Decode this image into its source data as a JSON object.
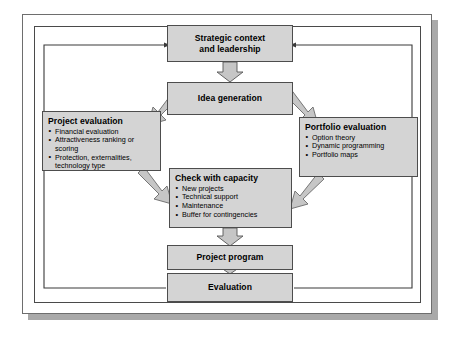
{
  "diagram": {
    "colors": {
      "box_fill": "#d4d4d4",
      "box_border": "#4d4d4d",
      "arrow_fill": "#c6c6c6",
      "arrow_border": "#555555",
      "frame_border": "#4a4a4a",
      "frame_shadow": "#a9a9a9",
      "line": "#3a3a3a"
    },
    "nodes": [
      {
        "id": "strategic-context",
        "title": "Strategic context",
        "title_line2": "and leadership",
        "bullets": []
      },
      {
        "id": "idea-generation",
        "title": "Idea generation",
        "bullets": []
      },
      {
        "id": "project-evaluation",
        "title": "Project evaluation",
        "bullets": [
          "Financial evaluation",
          "Attractiveness ranking or scoring",
          "Protection, externalities, technology type"
        ]
      },
      {
        "id": "portfolio-evaluation",
        "title": "Portfolio evaluation",
        "bullets": [
          "Option theory",
          "Dynamic programming",
          "Portfolio maps"
        ]
      },
      {
        "id": "check-with-capacity",
        "title": "Check with capacity",
        "bullets": [
          "New projects",
          "Technical support",
          "Maintenance",
          "Buffer for contingencies"
        ]
      },
      {
        "id": "project-program",
        "title": "Project program",
        "bullets": []
      },
      {
        "id": "evaluation",
        "title": "Evaluation",
        "bullets": []
      }
    ],
    "connectors": [
      {
        "from": "strategic-context",
        "to": "idea-generation",
        "style": "block-arrow-down"
      },
      {
        "from": "idea-generation",
        "to": "project-evaluation",
        "style": "diagonal-arrow-down-left"
      },
      {
        "from": "idea-generation",
        "to": "portfolio-evaluation",
        "style": "diagonal-arrow-down-right"
      },
      {
        "from": "project-evaluation",
        "to": "check-with-capacity",
        "style": "diagonal-arrow-down-right"
      },
      {
        "from": "portfolio-evaluation",
        "to": "check-with-capacity",
        "style": "diagonal-arrow-down-left"
      },
      {
        "from": "check-with-capacity",
        "to": "project-program",
        "style": "block-arrow-down"
      },
      {
        "from": "project-program",
        "to": "evaluation",
        "style": "block-arrow-down"
      },
      {
        "from": "evaluation",
        "to": "strategic-context",
        "style": "feedback-loop-left"
      },
      {
        "from": "evaluation",
        "to": "strategic-context",
        "style": "feedback-loop-right"
      }
    ]
  }
}
